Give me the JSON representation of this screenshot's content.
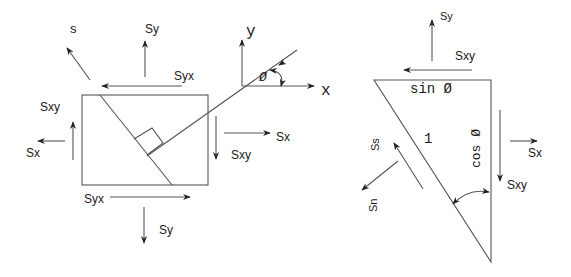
{
  "diagram": {
    "type": "stress-element-diagram",
    "colors": {
      "line": "#555555",
      "text": "#1a1a1a",
      "background": "#ffffff"
    },
    "left_figure": {
      "title": "stress element with inclined plane",
      "labels": {
        "s_normal": "s",
        "sy_top": "Sy",
        "syx_top": "Syx",
        "sxy_left": "Sxy",
        "sx_left": "Sx",
        "syx_bottom": "Syx",
        "sy_bottom": "Sy",
        "sxy_right": "Sxy",
        "sx_right": "Sx"
      },
      "axes": {
        "y_label": "y",
        "x_label": "x",
        "angle_label": "Ø"
      }
    },
    "right_figure": {
      "title": "free body wedge",
      "labels": {
        "sy_top": "Sy",
        "sxy_top": "Sxy",
        "top_side": "sin Ø",
        "hypotenuse": "1",
        "right_side": "cos Ø",
        "sx_right": "Sx",
        "sxy_right": "Sxy",
        "s_s": "Ss",
        "s_n": "Sn"
      }
    }
  }
}
